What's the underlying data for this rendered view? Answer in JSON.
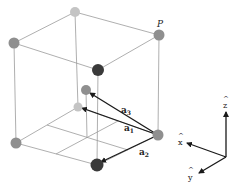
{
  "diagram": {
    "type": "crystal-unit-cell",
    "point_label": "P",
    "vectors": [
      {
        "name": "a1",
        "label_base": "a",
        "label_sub": "1"
      },
      {
        "name": "a2",
        "label_base": "a",
        "label_sub": "2"
      },
      {
        "name": "a3",
        "label_base": "a",
        "label_sub": "3"
      }
    ],
    "axes": [
      {
        "name": "x",
        "label": "x",
        "hat": "^"
      },
      {
        "name": "y",
        "label": "y",
        "hat": "^"
      },
      {
        "name": "z",
        "label": "z",
        "hat": "^"
      }
    ],
    "colors": {
      "line": "#9a9a9a",
      "arrow": "#1a1a1a",
      "atom_light": "#c4c4c4",
      "atom_mid": "#8f8f8f",
      "atom_dark": "#3a3a3a"
    }
  }
}
